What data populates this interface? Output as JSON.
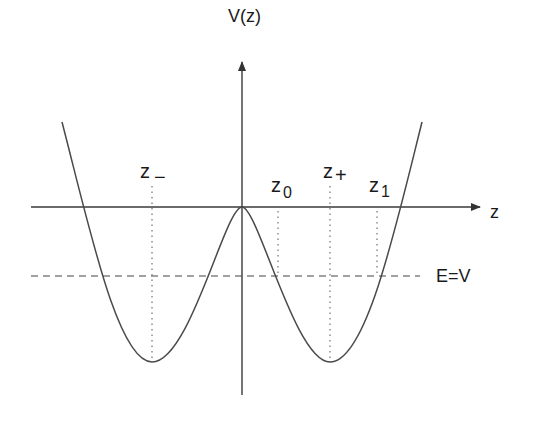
{
  "diagram": {
    "type": "double-well potential",
    "axes": {
      "vertical_label": "V(z)",
      "horizontal_label": "z"
    },
    "labels": {
      "z_minus": {
        "base": "z",
        "sub": "−"
      },
      "z_zero": {
        "base": "z",
        "sub": "0"
      },
      "z_plus": {
        "base": "z",
        "sub": "+"
      },
      "z_one": {
        "base": "z",
        "sub": "1"
      },
      "energy_line": "E=V"
    },
    "colors": {
      "curve": "#4a4a4a",
      "axes": "#3a3a3a",
      "text": "#1a1a1a",
      "background": "#ffffff"
    }
  }
}
